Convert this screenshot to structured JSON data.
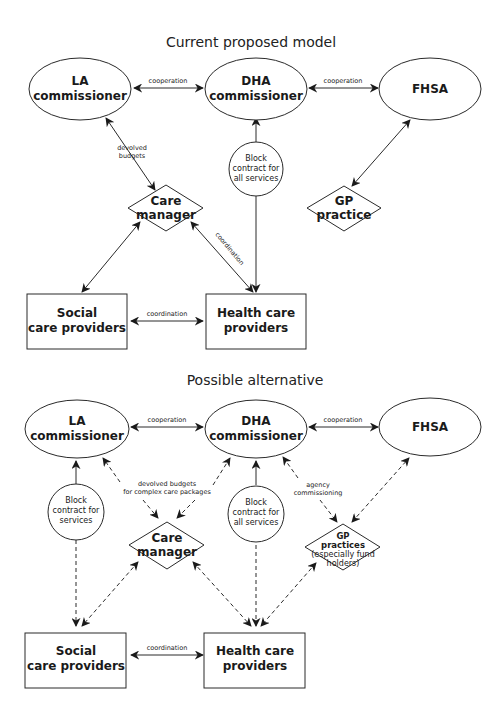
{
  "diagrams": [
    {
      "title": "Current proposed model",
      "nodes": {
        "la": {
          "line1": "LA",
          "line2": "commissioner"
        },
        "dha": {
          "line1": "DHA",
          "line2": "commissioner"
        },
        "fhsa": {
          "line1": "FHSA"
        },
        "block": {
          "line1": "Block",
          "line2": "contract for",
          "line3": "all services"
        },
        "care_manager": {
          "line1": "Care",
          "line2": "manager"
        },
        "gp": {
          "line1": "GP",
          "line2": "practice"
        },
        "social": {
          "line1": "Social",
          "line2": "care providers"
        },
        "health": {
          "line1": "Health care",
          "line2": "providers"
        }
      },
      "edge_labels": {
        "la_dha": "cooperation",
        "dha_fhsa": "cooperation",
        "devolved_1": "devolved",
        "devolved_2": "budgets",
        "coordination_diag": "coordination",
        "social_health": "coordination"
      }
    },
    {
      "title": "Possible alternative",
      "nodes": {
        "la": {
          "line1": "LA",
          "line2": "commissioner"
        },
        "dha": {
          "line1": "DHA",
          "line2": "commissioner"
        },
        "fhsa": {
          "line1": "FHSA"
        },
        "block_la": {
          "line1": "Block",
          "line2": "contract for",
          "line3": "services"
        },
        "block_dha": {
          "line1": "Block",
          "line2": "contract for",
          "line3": "all services"
        },
        "care_manager": {
          "line1": "Care",
          "line2": "manager"
        },
        "gp": {
          "line1": "GP",
          "line2": "practices",
          "line3": "(especially fund",
          "line4": "holders)"
        },
        "social": {
          "line1": "Social",
          "line2": "care providers"
        },
        "health": {
          "line1": "Health care",
          "line2": "providers"
        }
      },
      "edge_labels": {
        "la_dha": "cooperation",
        "dha_fhsa": "cooperation",
        "devolved_1": "devolved budgets",
        "devolved_2": "for complex care packages",
        "agency_1": "agency",
        "agency_2": "commissioning",
        "social_health": "coordination"
      }
    }
  ]
}
